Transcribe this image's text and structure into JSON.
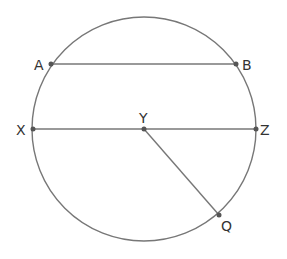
{
  "diagram": {
    "type": "circle-geometry",
    "stroke_color": "#777777",
    "point_color": "#555555",
    "circle": {
      "cx": 144,
      "cy": 129,
      "r": 112
    },
    "points": {
      "A": {
        "label": "A",
        "x": 51,
        "y": 64
      },
      "B": {
        "label": "B",
        "x": 236,
        "y": 64
      },
      "X": {
        "label": "X",
        "x": 33,
        "y": 129
      },
      "Z": {
        "label": "Z",
        "x": 256,
        "y": 129
      },
      "Y": {
        "label": "Y",
        "x": 144,
        "y": 129
      },
      "Q": {
        "label": "Q",
        "x": 219,
        "y": 215
      }
    },
    "segments": [
      {
        "name": "chord-AB",
        "from": "A",
        "to": "B"
      },
      {
        "name": "diameter-XZ",
        "from": "X",
        "to": "Z"
      },
      {
        "name": "radius-YQ",
        "from": "Y",
        "to": "Q"
      }
    ]
  }
}
